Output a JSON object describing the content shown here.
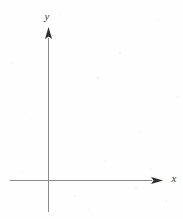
{
  "figure": {
    "kind": "cartesian-axes-diagram",
    "background_color": "#fefefe",
    "axis_color": "#8a8a8a",
    "arrow_color": "#2e2e2e",
    "label_color": "#3b3b3b",
    "width": 183,
    "height": 219
  },
  "labels": {
    "y_axis": "y",
    "x_axis": "x"
  },
  "chart_data": {
    "type": "scatter",
    "title": "",
    "subtitle": "",
    "xlabel": "x",
    "ylabel": "y",
    "series": [
      {
        "name": "",
        "x": [],
        "y": []
      }
    ],
    "x": [],
    "values": [],
    "categories": [],
    "xlim": [
      -0.45,
      1.45
    ],
    "ylim": [
      -0.25,
      1.25
    ],
    "xticks": [],
    "yticks": [],
    "xticklabels": [],
    "yticklabels": [],
    "grid": false,
    "legend": false,
    "legend_position": "none",
    "annotations": []
  },
  "geometry": {
    "origin": {
      "x": 48,
      "y": 180
    },
    "y_axis": {
      "x": 48,
      "top_tip": 27,
      "bottom_end": 212,
      "arrow_direction": "up",
      "arrow_width": 7,
      "arrow_length": 12
    },
    "x_axis": {
      "y": 180,
      "left_end": 10,
      "right_tip": 163,
      "arrow_direction": "right",
      "arrow_width": 7,
      "arrow_length": 12
    }
  }
}
